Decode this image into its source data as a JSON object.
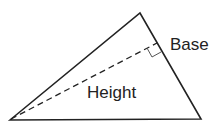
{
  "diagram": {
    "type": "triangle-area",
    "labels": {
      "base": "Base",
      "height": "Height"
    },
    "vertices": {
      "bottom_left": [
        10,
        120
      ],
      "top": [
        140,
        13
      ],
      "bottom_right": [
        201,
        119
      ]
    },
    "base_side": "top-to-bottom-right",
    "height_line": "dashed from bottom-left vertex perpendicular to base",
    "right_angle_marker": true,
    "colors": {
      "stroke": "#222222",
      "background": "#ffffff"
    }
  }
}
